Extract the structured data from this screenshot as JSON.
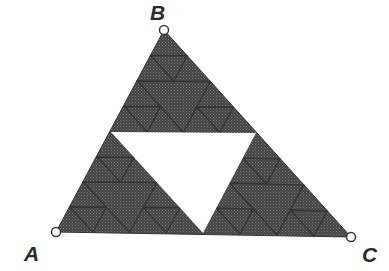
{
  "diagram": {
    "type": "sierpinski-triangle",
    "colors": {
      "background": "#ffffff",
      "fill": "#4a4a4a",
      "fill_dot": "#6a6a6a",
      "subdivision_line": "#2e2e2e",
      "hole": "#ffffff",
      "vertex_marker_stroke": "#3a3a3a",
      "label": "#2a2a2a"
    },
    "vertices": [
      {
        "label": "A",
        "x": 56,
        "y": 232,
        "label_x": 24,
        "label_y": 261
      },
      {
        "label": "B",
        "x": 164,
        "y": 30,
        "label_x": 150,
        "label_y": 20
      },
      {
        "label": "C",
        "x": 351,
        "y": 237,
        "label_x": 362,
        "label_y": 262
      }
    ],
    "center_hole": {
      "points": [
        {
          "x": 111,
          "y": 132
        },
        {
          "x": 256,
          "y": 133
        },
        {
          "x": 203,
          "y": 233
        }
      ]
    }
  }
}
